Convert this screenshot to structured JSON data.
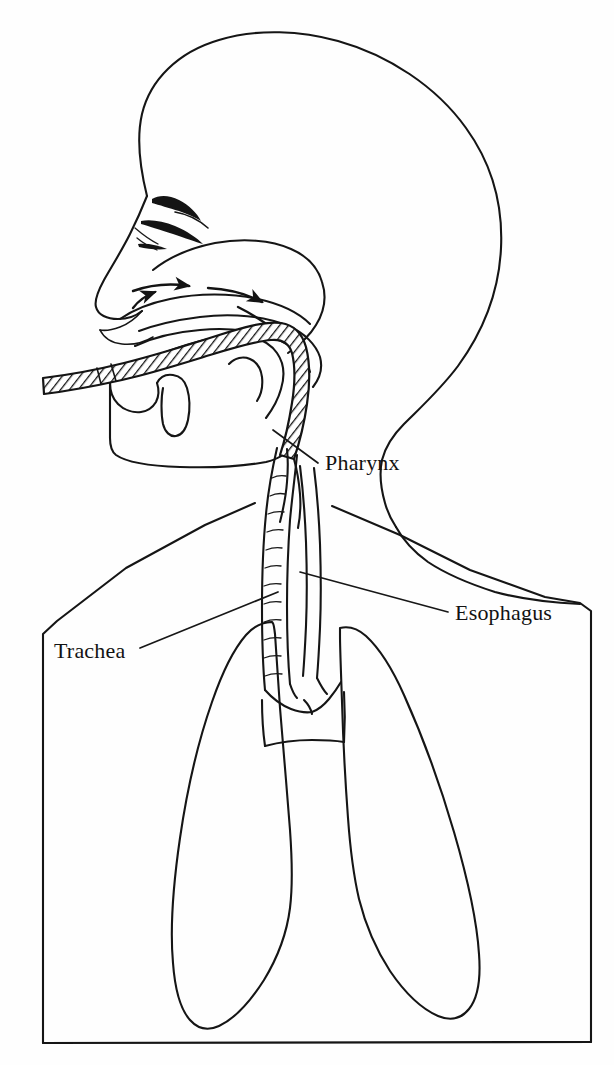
{
  "figure": {
    "kind": "anatomical-line-drawing",
    "background_color": "#fefefe",
    "ink_color": "#151515",
    "canvas": {
      "width": 614,
      "height": 1065
    }
  },
  "labels": [
    {
      "id": "pharynx",
      "text": "Pharynx",
      "x": 325,
      "y": 470,
      "leader_from": [
        318,
        462
      ],
      "leader_to": [
        273,
        430
      ]
    },
    {
      "id": "esophagus",
      "text": "Esophagus",
      "x": 455,
      "y": 620,
      "leader_from": [
        448,
        612
      ],
      "leader_to": [
        300,
        572
      ]
    },
    {
      "id": "trachea",
      "text": "Trachea",
      "x": 54,
      "y": 658,
      "leader_from": [
        140,
        648
      ],
      "leader_to": [
        278,
        592
      ]
    }
  ],
  "structures": [
    {
      "id": "skull-head-outline",
      "name": "Head and skull profile"
    },
    {
      "id": "nose-and-nostril",
      "name": "Nose with nostril"
    },
    {
      "id": "nasal-cavity",
      "name": "Nasal cavity"
    },
    {
      "id": "soft-palate",
      "name": "Soft palate"
    },
    {
      "id": "tongue",
      "name": "Tongue"
    },
    {
      "id": "lower-jaw",
      "name": "Lower jaw / chin"
    },
    {
      "id": "neck-back-profile",
      "name": "Posterior neck profile"
    },
    {
      "id": "inserted-tube",
      "name": "Hatched tube inserted through mouth into pharynx"
    },
    {
      "id": "trachea-tube",
      "name": "Trachea with cartilage rings"
    },
    {
      "id": "esophagus-tube",
      "name": "Esophagus"
    },
    {
      "id": "bronchi-bifurcation",
      "name": "Bronchial bifurcation"
    },
    {
      "id": "left-lung",
      "name": "Left lung (viewer left)"
    },
    {
      "id": "right-lung",
      "name": "Right lung (viewer right)"
    },
    {
      "id": "thorax-frame",
      "name": "Thoracic cavity outline frame"
    },
    {
      "id": "airflow-arrows",
      "name": "Airflow direction arrows through nasal cavity and pharynx"
    }
  ],
  "airflow_arrows": {
    "count": 4,
    "direction": "nasal cavity posteriorly and inferiorly into pharynx"
  }
}
